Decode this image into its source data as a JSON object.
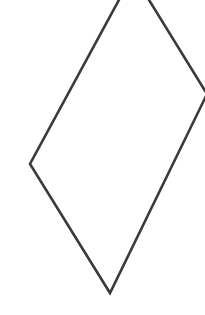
{
  "figure": {
    "shape": "rhombus",
    "stroke_color": "#3a3a3a",
    "fill_color": "none",
    "stroke_width": 2.6,
    "background": "#ffffff",
    "vertices": {
      "top": [
        133,
        -26
      ],
      "right": [
        207,
        94
      ],
      "bottom": [
        110,
        293
      ],
      "left": [
        30,
        164
      ]
    }
  }
}
